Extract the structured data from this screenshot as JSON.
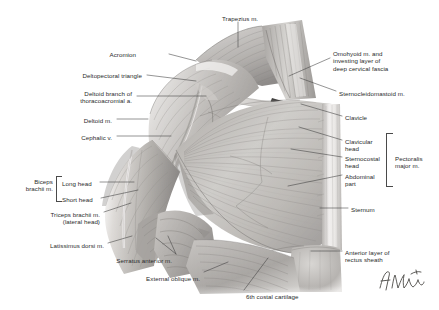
{
  "plate": {
    "kind": "anatomical-illustration",
    "title": "Anterior thoracoappendicular (pectoral) muscles — right shoulder and chest wall",
    "background_color": "#ffffff",
    "ink_color": "#2b2b2b",
    "leader_color": "#3c3c3c",
    "signature": "F. Netter"
  },
  "labels": [
    {
      "id": "trapezius",
      "text": "Trapezius m.",
      "align": "left",
      "x": 222,
      "y": 15
    },
    {
      "id": "acromion",
      "text": "Acromion",
      "align": "right",
      "x": 136,
      "y": 51
    },
    {
      "id": "omohyoid",
      "text": "Omohyoid m. and\ninvesting layer of\ndeep cervical fascia",
      "align": "left",
      "x": 333,
      "y": 50
    },
    {
      "id": "deltopectoral",
      "text": "Deltopectoral triangle",
      "align": "right",
      "x": 142,
      "y": 72
    },
    {
      "id": "deltoid-branch",
      "text": "Deltoid branch of\nthoracoacromial a.",
      "align": "right",
      "x": 132,
      "y": 90
    },
    {
      "id": "sternocleidomastoid",
      "text": "Sternocleidomastoid m.",
      "align": "left",
      "x": 339,
      "y": 90
    },
    {
      "id": "deltoid",
      "text": "Deltoid m.",
      "align": "right",
      "x": 112,
      "y": 117
    },
    {
      "id": "clavicle",
      "text": "Clavicle",
      "align": "left",
      "x": 345,
      "y": 114
    },
    {
      "id": "cephalic-vein",
      "text": "Cephalic v.",
      "align": "right",
      "x": 112,
      "y": 134
    },
    {
      "id": "clavicular-head",
      "text": "Clavicular\nhead",
      "align": "left",
      "x": 345,
      "y": 138
    },
    {
      "id": "pectoralis-major",
      "text": "Pectoralis\nmajor m.",
      "align": "left",
      "x": 395,
      "y": 155
    },
    {
      "id": "sternocostal-head",
      "text": "Sternocostal\nhead",
      "align": "left",
      "x": 345,
      "y": 155
    },
    {
      "id": "biceps-brachii",
      "text": "Biceps\nbrachii m.",
      "align": "right",
      "x": 53,
      "y": 178
    },
    {
      "id": "long-head",
      "text": "Long head",
      "align": "left",
      "x": 62,
      "y": 180
    },
    {
      "id": "abdominal-part",
      "text": "Abdominal\npart",
      "align": "left",
      "x": 345,
      "y": 173
    },
    {
      "id": "short-head",
      "text": "Short head",
      "align": "left",
      "x": 62,
      "y": 196
    },
    {
      "id": "triceps-brachii",
      "text": "Triceps brachii m.\n(lateral head)",
      "align": "right",
      "x": 100,
      "y": 211
    },
    {
      "id": "sternum",
      "text": "Sternum",
      "align": "left",
      "x": 351,
      "y": 206
    },
    {
      "id": "latissimus-dorsi",
      "text": "Latissimus dorsi m.",
      "align": "right",
      "x": 104,
      "y": 242
    },
    {
      "id": "serratus-anterior",
      "text": "Serratus anterior m.",
      "align": "right",
      "x": 172,
      "y": 257
    },
    {
      "id": "anterior-rectus-sheath",
      "text": "Anterior layer of\nrectus sheath",
      "align": "left",
      "x": 345,
      "y": 249
    },
    {
      "id": "external-oblique",
      "text": "External oblique m.",
      "align": "right",
      "x": 200,
      "y": 275
    },
    {
      "id": "sixth-costal",
      "text": "6th costal cartilage",
      "align": "left",
      "x": 246,
      "y": 293
    }
  ],
  "brackets": [
    {
      "id": "pectoralis-major-bracket",
      "for": "Pectoralis major m.",
      "x": 386,
      "y": 133,
      "w": 6,
      "h": 52,
      "side": "left"
    },
    {
      "id": "biceps-brachii-bracket",
      "for": "Biceps brachii m.",
      "x": 56,
      "y": 176,
      "w": 5,
      "h": 24,
      "side": "left"
    }
  ],
  "leaders": [
    {
      "for": "trapezius",
      "path": "M 238 22 L 238 47"
    },
    {
      "for": "acromion",
      "path": "M 169 54 L 196 61"
    },
    {
      "for": "omohyoid",
      "path": "M 330 58 L 289 76"
    },
    {
      "for": "deltopectoral",
      "path": "M 147 75 L 196 81"
    },
    {
      "for": "deltoid-branch",
      "path": "M 137 96 L 206 96"
    },
    {
      "for": "sternocleidomastoid",
      "path": "M 336 91 L 300 78"
    },
    {
      "for": "deltoid",
      "path": "M 117 119 L 148 119"
    },
    {
      "for": "clavicle",
      "path": "M 342 116 L 301 104"
    },
    {
      "for": "cephalic-vein",
      "path": "M 117 136 L 171 136"
    },
    {
      "for": "clavicular-head",
      "path": "M 342 140 L 299 127"
    },
    {
      "for": "sternocostal-head",
      "path": "M 342 157 L 291 149"
    },
    {
      "for": "abdominal-part",
      "path": "M 342 175 L 288 186"
    },
    {
      "for": "long-head",
      "path": "M 100 182 L 134 182"
    },
    {
      "for": "short-head",
      "path": "M 101 198 L 138 190"
    },
    {
      "for": "triceps-brachii",
      "path": "M 104 212 L 131 203"
    },
    {
      "for": "sternum",
      "path": "M 348 208 L 320 208"
    },
    {
      "for": "latissimus-dorsi",
      "path": "M 108 243 L 132 236"
    },
    {
      "for": "serratus-anterior",
      "path": "M 176 254 L 156 238"
    },
    {
      "for": "serratus-anterior-2",
      "path": "M 176 254 L 168 236"
    },
    {
      "for": "anterior-rectus-sheath",
      "path": "M 342 251 L 311 251"
    },
    {
      "for": "external-oblique",
      "path": "M 204 272 L 228 262"
    },
    {
      "for": "sixth-costal",
      "path": "M 244 290 L 268 258"
    }
  ]
}
